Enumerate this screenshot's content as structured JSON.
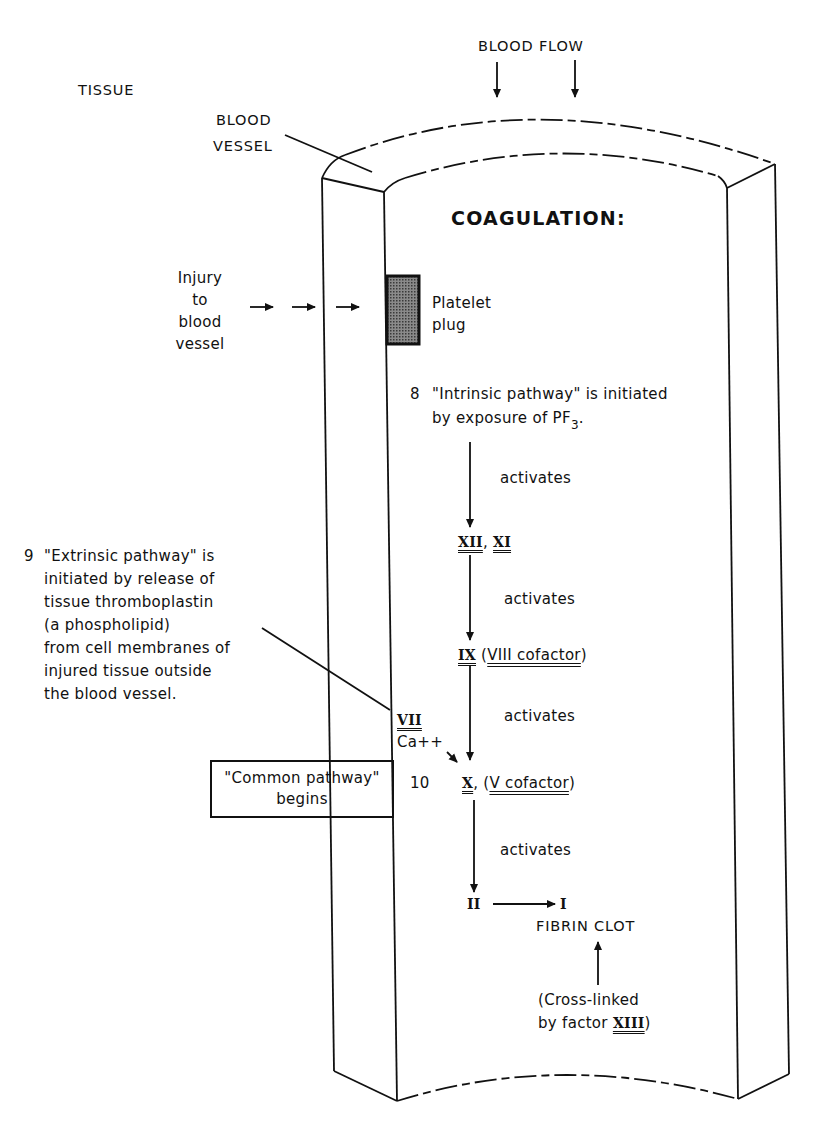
{
  "diagram": {
    "title": "COAGULATION:",
    "labels": {
      "tissue": "TISSUE",
      "blood_vessel_line1": "BLOOD",
      "blood_vessel_line2": "VESSEL",
      "blood_flow": "BLOOD FLOW"
    },
    "injury": {
      "lines": [
        "Injury",
        "to",
        "blood",
        "vessel"
      ]
    },
    "platelet_plug": {
      "lines": [
        "Platelet",
        "plug"
      ],
      "fill_color": "#555555"
    },
    "intrinsic": {
      "step_number": "8",
      "line1": "\"Intrinsic pathway\" is initiated",
      "line2_prefix": "by exposure of PF",
      "line2_subscript": "3",
      "line2_suffix": "."
    },
    "extrinsic": {
      "step_number": "9",
      "lines": [
        "\"Extrinsic pathway\" is",
        "initiated by release of",
        "tissue thromboplastin",
        "(a phospholipid)",
        "from cell membranes of",
        "injured tissue outside",
        "the blood vessel."
      ]
    },
    "cascade": {
      "activates_label": "activates",
      "factor_xii": "XII",
      "factor_xi": "XI",
      "factor_ix": "IX",
      "factor_viii_cofactor": "VIII cofactor",
      "factor_vii": "VII",
      "calcium": "Ca++",
      "step_10_number": "10",
      "factor_x": "X",
      "factor_v_cofactor": "V cofactor",
      "factor_ii": "II",
      "factor_i": "I",
      "fibrin_clot": "FIBRIN CLOT",
      "cross_linked_line1": "(Cross-linked",
      "cross_linked_line2_prefix": "by factor ",
      "cross_linked_factor": "XIII",
      "cross_linked_line2_suffix": ")"
    },
    "common_pathway": {
      "line1": "\"Common pathway\"",
      "line2": "begins"
    }
  }
}
